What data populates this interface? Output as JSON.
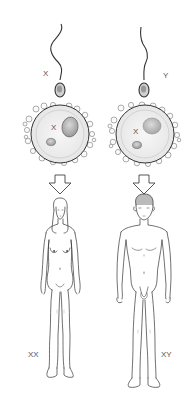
{
  "diagram": {
    "columns": [
      {
        "id": "female",
        "sperm_label": "X",
        "egg_label": "X",
        "result_label": "XX",
        "result": "female"
      },
      {
        "id": "male",
        "sperm_label": "Y",
        "egg_label": "X",
        "result_label": "XY",
        "result": "male"
      }
    ],
    "icons": {
      "sperm": "sperm-icon",
      "egg": "egg-cell-icon",
      "arrow": "down-arrow-icon",
      "female_figure": "female-figure-icon",
      "male_figure": "male-figure-icon"
    },
    "colors": {
      "line": "#333333",
      "label": "#555555",
      "background": "#ffffff"
    }
  }
}
